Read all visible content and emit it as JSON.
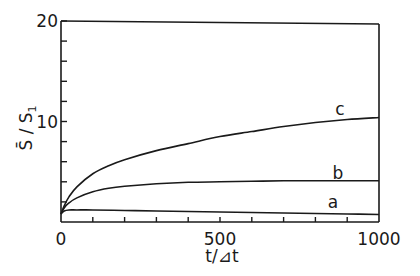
{
  "chart_data": {
    "type": "line",
    "title": "",
    "xlabel": "t/Δt",
    "ylabel": "S̄ / S₁",
    "xlim": [
      0,
      1000
    ],
    "ylim": [
      0,
      20
    ],
    "grid": false,
    "legend": "inline labels at right end of curves",
    "x_ticks": [
      0,
      500,
      1000
    ],
    "x_tick_labels": [
      "0",
      "500",
      "1000"
    ],
    "x_minor_ticks": [
      100,
      200,
      300,
      400,
      500,
      600,
      700,
      800,
      900
    ],
    "y_ticks": [
      10,
      20
    ],
    "y_tick_labels": [
      "10",
      "20"
    ],
    "y_minor_ticks": [
      2,
      4,
      6,
      8,
      12,
      14,
      16,
      18
    ],
    "series": [
      {
        "name": "a",
        "x": [
          0,
          10,
          25,
          50,
          100,
          200,
          300,
          400,
          500,
          600,
          700,
          800,
          900,
          1000
        ],
        "y": [
          0.8,
          1.1,
          1.2,
          1.2,
          1.2,
          1.15,
          1.1,
          1.05,
          1.0,
          0.95,
          0.9,
          0.85,
          0.8,
          0.75
        ]
      },
      {
        "name": "b",
        "x": [
          0,
          10,
          25,
          50,
          100,
          150,
          200,
          300,
          400,
          500,
          600,
          700,
          800,
          900,
          1000
        ],
        "y": [
          0.8,
          1.4,
          1.9,
          2.4,
          3.0,
          3.35,
          3.55,
          3.8,
          3.95,
          4.0,
          4.05,
          4.1,
          4.1,
          4.1,
          4.1
        ]
      },
      {
        "name": "c",
        "x": [
          0,
          10,
          25,
          50,
          100,
          150,
          200,
          300,
          400,
          500,
          600,
          700,
          800,
          900,
          1000
        ],
        "y": [
          0.8,
          1.6,
          2.5,
          3.5,
          4.8,
          5.6,
          6.2,
          7.1,
          7.8,
          8.5,
          9.0,
          9.5,
          9.9,
          10.2,
          10.4
        ]
      }
    ]
  },
  "labels": {
    "x_axis_title": "t/⊿t",
    "y_axis_main": "S̄",
    "y_axis_sep": " / ",
    "y_axis_sub": "S",
    "y_axis_subscript": "1"
  }
}
